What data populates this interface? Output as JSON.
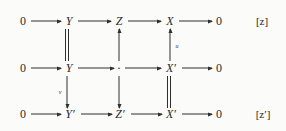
{
  "diagram": {
    "type": "commutative-diagram",
    "rows": [
      {
        "id": "top",
        "label": "[z]",
        "label_base": "z",
        "label_prime": "",
        "nodes": [
          "0",
          "Y",
          "Z",
          "X",
          "0"
        ]
      },
      {
        "id": "middle",
        "label": "",
        "label_base": "",
        "label_prime": "",
        "nodes": [
          "0",
          "Y",
          "·",
          "X′",
          "0"
        ]
      },
      {
        "id": "bottom",
        "label": "[z′]",
        "label_base": "z",
        "label_prime": "′",
        "nodes": [
          "0",
          "Y′",
          "Z′",
          "X′",
          "0"
        ]
      }
    ],
    "vertical_maps": [
      {
        "id": "y-top-middle",
        "style": "equality",
        "label": "",
        "from": "Y",
        "to": "Y"
      },
      {
        "id": "z-middle-top",
        "style": "arrow-up",
        "label": "",
        "from": "·",
        "to": "Z"
      },
      {
        "id": "x-middle-top",
        "style": "arrow-up",
        "label": "u",
        "from": "X′",
        "to": "X"
      },
      {
        "id": "y-middle-bottom",
        "style": "arrow-down",
        "label": "v",
        "from": "Y",
        "to": "Y′"
      },
      {
        "id": "z-middle-bottom",
        "style": "arrow-down",
        "label": "",
        "from": "·",
        "to": "Z′"
      },
      {
        "id": "x-middle-bottom",
        "style": "equality",
        "label": "",
        "from": "X′",
        "to": "X′"
      }
    ],
    "colors": {
      "background": "#fbfbfa",
      "ink": "#2f2f2f",
      "text": "#2a2a2a"
    }
  }
}
